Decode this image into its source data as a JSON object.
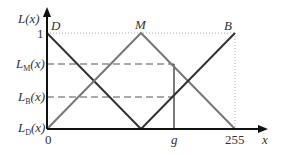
{
  "diagram": {
    "y_axis_label": "L(x)",
    "x_axis_label": "x",
    "y_ticks": {
      "one": "1",
      "LM": {
        "main": "L",
        "sub": "M",
        "arg": "(x)"
      },
      "LB": {
        "main": "L",
        "sub": "B",
        "arg": "(x)"
      },
      "LD": {
        "main": "L",
        "sub": "D",
        "arg": "(x)"
      }
    },
    "x_ticks": {
      "zero": "0",
      "g": "g",
      "max": "255"
    },
    "curve_labels": {
      "D": "D",
      "M": "M",
      "B": "B"
    },
    "colors": {
      "axis": "#111111",
      "line_D": "#333333",
      "line_M": "#777777",
      "line_B": "#333333",
      "guide": "#999999"
    }
  }
}
